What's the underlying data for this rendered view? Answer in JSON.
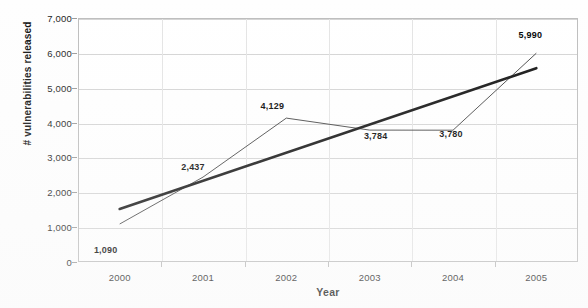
{
  "chart_data": {
    "type": "line",
    "title": "",
    "xlabel": "Year",
    "ylabel": "# vulnerabilities released",
    "categories": [
      "2000",
      "2001",
      "2002",
      "2003",
      "2004",
      "2005"
    ],
    "series": [
      {
        "name": "# vulnerabilities released",
        "values": [
          1090,
          2437,
          4129,
          3784,
          3780,
          5990
        ],
        "labels": [
          "1,090",
          "2,437",
          "4,129",
          "3,784",
          "3,780",
          "5,990"
        ],
        "style": "thin-line"
      },
      {
        "name": "linear trendline",
        "values": [
          1520,
          2370,
          3220,
          4070,
          4920,
          5560
        ],
        "style": "thick-line"
      }
    ],
    "ylim": [
      0,
      7000
    ],
    "ytick_values": [
      0,
      1000,
      2000,
      3000,
      4000,
      5000,
      6000,
      7000
    ],
    "ytick_labels": [
      "0",
      "1,000",
      "2,000",
      "3,000",
      "4,000",
      "5,000",
      "6,000",
      "7,000"
    ],
    "xtick_labels": [
      "2000",
      "2001",
      "2002",
      "2003",
      "2004",
      "2005"
    ],
    "grid": true,
    "legend": "none",
    "colors": {
      "data_line": "#333333",
      "trend_line": "#111111",
      "gridline": "#d4d4d4",
      "frame": "#bdbdbd",
      "text": "#1a1a1a",
      "background": "#ffffff"
    }
  }
}
